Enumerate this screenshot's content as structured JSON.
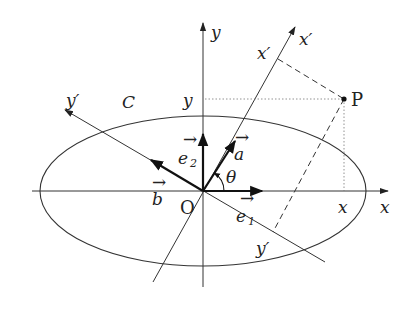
{
  "figure": {
    "labels": {
      "x_axis": "x",
      "y_axis": "y",
      "x_prime_axis": "x′",
      "x_prime_axis_end": "x′",
      "y_prime_axis": "y′",
      "y_prime_axis_end": "y′",
      "curve": "C",
      "origin": "O",
      "point": "P",
      "x_coord": "x",
      "y_coord": "y",
      "angle": "θ",
      "vec_e1": "e",
      "vec_e1_sub": "1",
      "vec_e2": "e",
      "vec_e2_sub": "2",
      "vec_a": "a",
      "vec_b": "b",
      "vec_arrow": "→"
    },
    "colors": {
      "line": "#333333",
      "background": "#ffffff"
    }
  }
}
